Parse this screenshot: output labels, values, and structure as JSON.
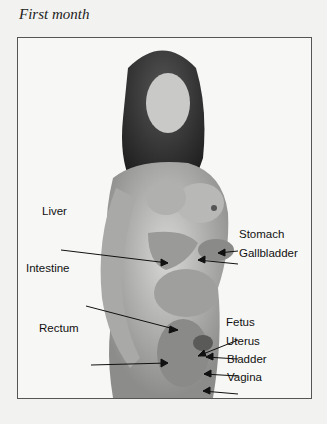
{
  "title": "First month",
  "labels": {
    "liver": "Liver",
    "intestine": "Intestine",
    "rectum": "Rectum",
    "stomach": "Stomach",
    "gallbladder": "Gallbladder",
    "fetus": "Fetus",
    "uterus": "Uterus",
    "bladder": "Bladder",
    "vagina": "Vagina"
  }
}
